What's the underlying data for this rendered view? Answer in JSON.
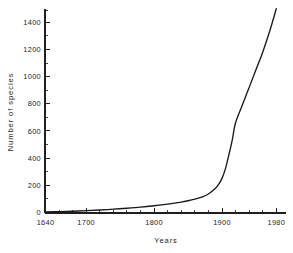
{
  "chart_data": {
    "type": "line",
    "title": "",
    "xlabel": "Years",
    "ylabel": "Number of species",
    "xlim": [
      1640,
      1990
    ],
    "ylim": [
      0,
      1530
    ],
    "grid": false,
    "legend": null,
    "x_ticks": [
      1640,
      1700,
      1800,
      1900,
      1980
    ],
    "x_tick_labels": [
      "1640",
      "1700",
      "1800",
      "1900",
      "1980"
    ],
    "x_minor_ticks": [
      1660,
      1680,
      1720,
      1740,
      1760,
      1780,
      1820,
      1840,
      1860,
      1880,
      1920,
      1940,
      1960
    ],
    "y_ticks": [
      0,
      200,
      400,
      600,
      800,
      1000,
      1200,
      1400
    ],
    "y_tick_labels": [
      "0",
      "200",
      "400",
      "600",
      "800",
      "1000",
      "1200",
      "1400"
    ],
    "y_minor_ticks": [
      100,
      300,
      500,
      700,
      900,
      1100,
      1300,
      1500
    ],
    "series": [
      {
        "name": "Cumulative number of species",
        "color": "#1a1a1a",
        "x": [
          1640,
          1660,
          1680,
          1700,
          1720,
          1740,
          1760,
          1780,
          1800,
          1820,
          1840,
          1850,
          1860,
          1870,
          1880,
          1890,
          1895,
          1900,
          1905,
          1910,
          1915,
          1920,
          1930,
          1940,
          1950,
          1960,
          1970,
          1980
        ],
        "y": [
          2,
          5,
          8,
          12,
          17,
          23,
          30,
          38,
          48,
          60,
          75,
          85,
          97,
          112,
          135,
          175,
          205,
          250,
          320,
          420,
          530,
          660,
          790,
          920,
          1050,
          1180,
          1330,
          1500
        ]
      }
    ]
  },
  "axis_labels": {
    "x_title": "Years",
    "y_title": "Number of species"
  }
}
